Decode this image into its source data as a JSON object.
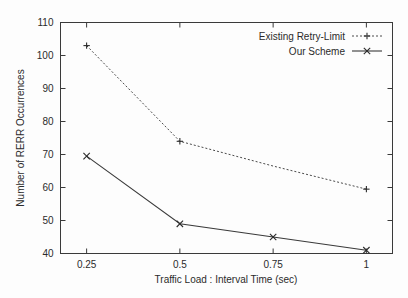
{
  "chart_data": {
    "type": "line",
    "title": "",
    "xlabel": "Traffic Load : Interval Time (sec)",
    "ylabel": "Number of RERR Occurrences",
    "categories": [
      "0.25",
      "0.5",
      "0.75",
      "1"
    ],
    "x": [
      0.25,
      0.5,
      0.75,
      1
    ],
    "xlim": [
      0.18,
      1.07
    ],
    "ylim": [
      40,
      110
    ],
    "yticks": [
      40,
      50,
      60,
      70,
      80,
      90,
      100,
      110
    ],
    "ytick_labels": [
      "40",
      "50",
      "60",
      "70",
      "80",
      "90",
      "100",
      "110"
    ],
    "xticks": [
      0.25,
      0.5,
      0.75,
      1
    ],
    "xtick_labels": [
      "0.25",
      "0.5",
      "0.75",
      "1"
    ],
    "grid": false,
    "legend_position": "top-right",
    "series": [
      {
        "name": "Existing Retry-Limit",
        "marker": "plus",
        "linestyle": "dashed",
        "color": "#4a4a4a",
        "values": [
          103,
          74,
          66.5,
          59.5
        ]
      },
      {
        "name": "Our Scheme",
        "marker": "cross",
        "linestyle": "solid",
        "color": "#3a3a3a",
        "values": [
          69.5,
          49,
          45,
          41
        ]
      }
    ]
  },
  "legend": {
    "entries": [
      {
        "label": "Existing Retry-Limit",
        "marker": "plus"
      },
      {
        "label": "Our Scheme",
        "marker": "cross"
      }
    ]
  },
  "axes": {
    "x_title": "Traffic Load : Interval Time (sec)",
    "y_title": "Number of RERR Occurrences"
  }
}
